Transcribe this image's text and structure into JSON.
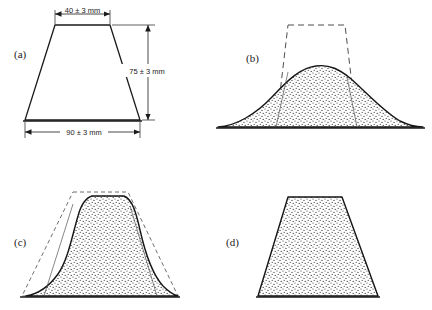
{
  "figure": {
    "background_color": "#ffffff",
    "ink_color": "#1a1a1a"
  },
  "panels": [
    {
      "id": "a",
      "label": "(a)",
      "description": "reference trapezoidal mold with nominal dimensions",
      "fill": "none",
      "has_ghost_outline": false
    },
    {
      "id": "b",
      "label": "(b)",
      "description": "fully collapsed specimen spreading well beyond the mold outline",
      "fill": "stipple",
      "has_ghost_outline": true
    },
    {
      "id": "c",
      "label": "(c)",
      "description": "moderately slumped specimen with slightly rounded shoulders",
      "fill": "stipple",
      "has_ghost_outline": true
    },
    {
      "id": "d",
      "label": "(d)",
      "description": "specimen retaining the full mold shape with no slump",
      "fill": "stipple",
      "has_ghost_outline": false
    }
  ],
  "dimensions": [
    {
      "name": "top-width",
      "text": "40 ± 3 mm",
      "value": 40,
      "tolerance": 3,
      "unit": "mm",
      "orientation": "horizontal",
      "location": "top"
    },
    {
      "name": "height",
      "text": "75 ± 3 mm",
      "value": 75,
      "tolerance": 3,
      "unit": "mm",
      "orientation": "vertical",
      "location": "right"
    },
    {
      "name": "bottom-width",
      "text": "90 ± 3 mm",
      "value": 90,
      "tolerance": 3,
      "unit": "mm",
      "orientation": "horizontal",
      "location": "bottom"
    }
  ]
}
